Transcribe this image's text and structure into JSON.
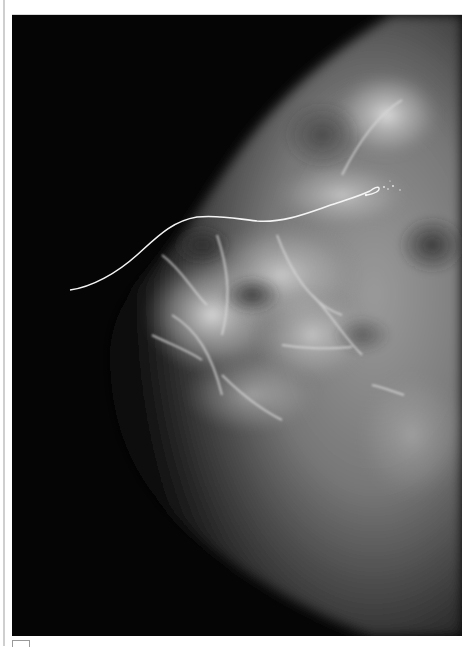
{
  "figure": {
    "type": "mammogram",
    "view": "breast radiograph with hook-wire needle localization",
    "colors": {
      "background": "#050505",
      "tissue_light": "#d0d0d0",
      "tissue_mid": "#6e6e6e",
      "wire": "#f4f4f4",
      "page": "#ffffff"
    },
    "wire": {
      "entry_point": [
        58,
        275
      ],
      "hook_tip": [
        358,
        172
      ],
      "shape": "S-curve ending in hook"
    }
  }
}
